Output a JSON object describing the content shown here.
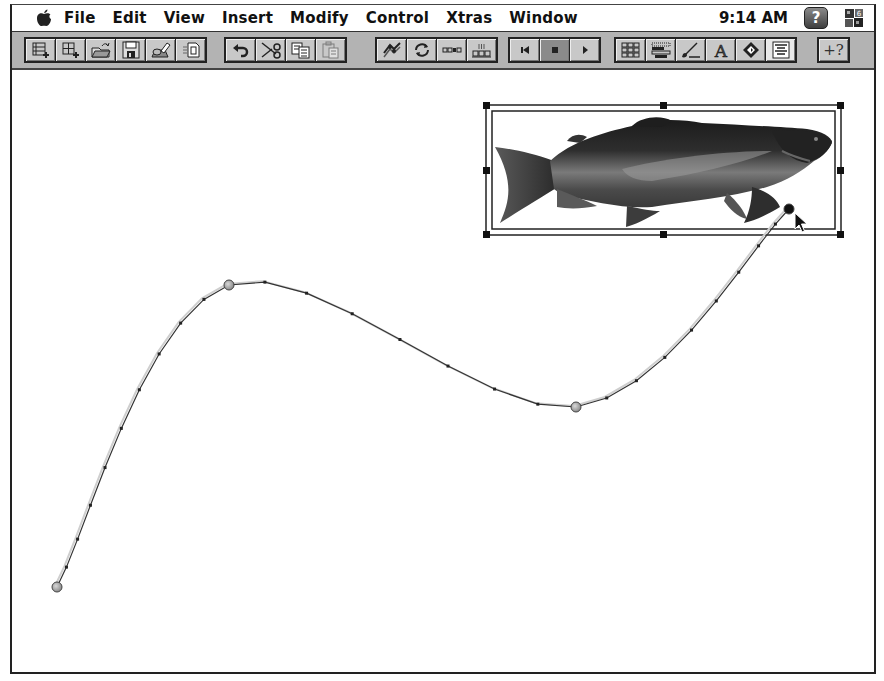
{
  "menubar": {
    "apple_icon": "apple-icon",
    "items": [
      "File",
      "Edit",
      "View",
      "Insert",
      "Modify",
      "Control",
      "Xtras",
      "Window"
    ],
    "clock": "9:14 AM",
    "help_icon": "help-balloon-icon",
    "help_glyph": "?",
    "app_icon": "director-app-icon"
  },
  "toolbar": {
    "groups": [
      {
        "name": "file",
        "buttons": [
          {
            "id": "new-movie",
            "icon": "new-movie-icon"
          },
          {
            "id": "new-cast",
            "icon": "new-cast-icon"
          },
          {
            "id": "open",
            "icon": "open-folder-icon"
          },
          {
            "id": "save",
            "icon": "floppy-disk-icon"
          },
          {
            "id": "import",
            "icon": "import-icon"
          },
          {
            "id": "save-and-compact",
            "icon": "compact-icon"
          }
        ]
      },
      {
        "name": "edit",
        "buttons": [
          {
            "id": "undo",
            "icon": "undo-icon"
          },
          {
            "id": "cut",
            "icon": "scissors-icon"
          },
          {
            "id": "copy",
            "icon": "copy-icon"
          },
          {
            "id": "paste",
            "icon": "paste-icon",
            "disabled": true
          }
        ]
      },
      {
        "name": "sprite",
        "buttons": [
          {
            "id": "exchange-cast",
            "icon": "exchange-cast-members-icon"
          },
          {
            "id": "loop",
            "icon": "loop-playback-icon"
          },
          {
            "id": "volume",
            "icon": "sprite-channel-icon"
          },
          {
            "id": "score-channels",
            "icon": "score-channels-icon"
          }
        ]
      },
      {
        "name": "playback",
        "buttons": [
          {
            "id": "rewind",
            "icon": "rewind-icon"
          },
          {
            "id": "stop",
            "icon": "stop-icon",
            "active": true
          },
          {
            "id": "play",
            "icon": "play-icon"
          }
        ]
      },
      {
        "name": "windows",
        "buttons": [
          {
            "id": "cast-window",
            "icon": "cast-window-icon"
          },
          {
            "id": "score-window",
            "icon": "score-window-icon"
          },
          {
            "id": "paint-window",
            "icon": "paint-brush-icon"
          },
          {
            "id": "text-window",
            "icon": "text-window-icon"
          },
          {
            "id": "tool-palette",
            "icon": "tool-palette-icon"
          },
          {
            "id": "message-window",
            "icon": "message-window-icon"
          }
        ]
      },
      {
        "name": "help",
        "buttons": [
          {
            "id": "context-help",
            "icon": "context-help-icon",
            "glyph": "+?"
          }
        ]
      }
    ]
  },
  "stage": {
    "sprite": {
      "name": "trout",
      "cast_type": "bitmap",
      "selected": true
    },
    "tween_path": {
      "keyframes": [
        {
          "label": "keyframe-1",
          "x": 55,
          "y": 586,
          "selected": false
        },
        {
          "label": "keyframe-2",
          "x": 227,
          "y": 284,
          "selected": false
        },
        {
          "label": "keyframe-3",
          "x": 574,
          "y": 406,
          "selected": false
        },
        {
          "label": "keyframe-4",
          "x": 787,
          "y": 208,
          "selected": true
        }
      ]
    },
    "cursor": "arrow-pointer-icon"
  }
}
